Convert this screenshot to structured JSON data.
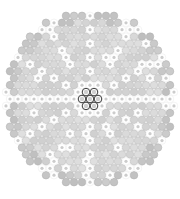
{
  "figure": {
    "name": "fiber-bundle-cross-section",
    "type": "packed-circle-diagram",
    "background_color": "#ffffff",
    "canvas": {
      "width": 180,
      "height": 199
    }
  },
  "bundle": {
    "center_x": 90,
    "center_y": 99,
    "radius_x": 88,
    "radius_y": 91,
    "lattice": "hexagonal",
    "pitch": 8.0,
    "element_radius": 3.8,
    "rings": 11
  },
  "palette": {
    "background": "#ffffff",
    "element_fill": "#d2d2d2",
    "element_stroke": "#bdbdbd",
    "outer_fill": "#c2c2c2",
    "outer_stroke": "#b0b0b0",
    "marked_ring_fill": "#ffffff",
    "marked_core_fill": "#cccccc",
    "marked_stroke": "#e8e8e8",
    "core_stroke": "#3a3a3a",
    "core_fill": "#ffffff",
    "core_inner_fill": "#d0d0d0"
  },
  "core_cluster": {
    "label": "central-seven-cluster",
    "count": 7,
    "arrangement": "hexagonal-close-pack",
    "stroke_color": "#3a3a3a",
    "fill_color": "#ffffff",
    "element_radius": 3.8,
    "offsets": [
      [
        0,
        0
      ],
      [
        8,
        0
      ],
      [
        -8,
        0
      ],
      [
        4,
        -6.93
      ],
      [
        -4,
        -6.93
      ],
      [
        4,
        6.93
      ],
      [
        -4,
        6.93
      ]
    ]
  },
  "marked_pattern": {
    "description": "white-ringed elements forming radial spokes and a central horizontal row",
    "horizontal_row": {
      "enabled": true,
      "row_index": 0,
      "skip_core": true
    },
    "spoke_count": 12,
    "spoke_step": 2
  },
  "chart_data": {
    "type": "scatter",
    "title": "",
    "xlabel": "",
    "ylabel": "",
    "categories": [
      "standard-element",
      "marked-element",
      "outer-element",
      "core-element"
    ],
    "values": [
      0,
      0,
      0,
      7
    ],
    "note": "hexagonally packed circular elements within a circular boundary"
  }
}
